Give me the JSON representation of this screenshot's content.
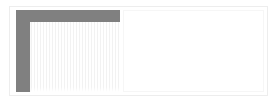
{
  "window": {
    "title": "",
    "frame_color": "#ededed",
    "background": "#ffffff"
  },
  "chrome": {
    "color": "#808080",
    "header_bar_label": "",
    "sidebar_label": ""
  },
  "left_panel": {
    "name": "grid-panel",
    "grid": {
      "stripe_color": "#f2f2f2",
      "background": "#ffffff",
      "column_count": 30,
      "label": ""
    }
  },
  "right_panel": {
    "name": "content-panel",
    "background": "#ffffff",
    "border_color": "#f6f6f6",
    "content": ""
  }
}
